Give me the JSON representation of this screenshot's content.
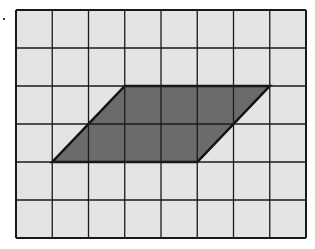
{
  "diagram": {
    "type": "grid-with-parallelogram",
    "grid": {
      "columns": 8,
      "rows": 6,
      "x0": 16,
      "y0": 10,
      "x1": 306,
      "y1": 238,
      "cell_fill": "#e4e4e4",
      "line_color": "#1a1a1a"
    },
    "parallelogram": {
      "vertices_grid_units": [
        [
          3,
          2
        ],
        [
          7,
          2
        ],
        [
          5,
          4
        ],
        [
          1,
          4
        ]
      ],
      "fill": "#6b6b6b",
      "stroke": "#111111"
    },
    "marker": {
      "x": 3,
      "y": 18
    }
  }
}
